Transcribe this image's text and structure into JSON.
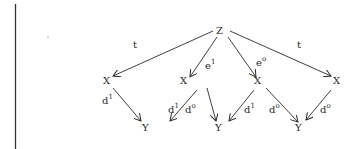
{
  "diagram": {
    "colors": {
      "ink": "#2a2a2a",
      "background": "#ffffff"
    },
    "nodes": {
      "z": {
        "label": "Z",
        "x": 220,
        "y": 33
      },
      "x1": {
        "label": "X",
        "x": 105,
        "y": 83
      },
      "x2": {
        "label": "X",
        "x": 210,
        "y": 83
      },
      "x3": {
        "label": "X",
        "x": 280,
        "y": 83
      },
      "x4": {
        "label": "X",
        "x": 339,
        "y": 83
      },
      "y1": {
        "label": "Y",
        "x": 146,
        "y": 131
      },
      "y2": {
        "label": "Y",
        "x": 219,
        "y": 131
      },
      "y3": {
        "label": "Y",
        "x": 299,
        "y": 131
      },
      "y4": {
        "label": "Y",
        "x": 346,
        "y": 131
      }
    },
    "edges": [
      {
        "from": "z",
        "to": "x1",
        "label": "t",
        "sup": ""
      },
      {
        "from": "z",
        "to": "x2",
        "label": "e",
        "sup": "1"
      },
      {
        "from": "z",
        "to": "x3",
        "label": "e",
        "sup": "o"
      },
      {
        "from": "z",
        "to": "x4",
        "label": "t",
        "sup": ""
      },
      {
        "from": "x1",
        "to": "y1",
        "label": "d",
        "sup": "1"
      },
      {
        "from": "x2",
        "to": "y1",
        "label": "d",
        "sup": "1"
      },
      {
        "from": "x2",
        "to": "y2",
        "label": "d",
        "sup": "o"
      },
      {
        "from": "x3",
        "to": "y2",
        "label": "d",
        "sup": "1"
      },
      {
        "from": "x3",
        "to": "y3",
        "label": "d",
        "sup": "o"
      },
      {
        "from": "x4",
        "to": "y3",
        "label": "d",
        "sup": "o"
      }
    ],
    "labels": {
      "t_left": "t",
      "e1_base": "e",
      "e1_sup": "1",
      "e0_base": "e",
      "e0_sup": "o",
      "t_right": "t",
      "d1_a_base": "d",
      "d1_a_sup": "1",
      "d1_b_base": "d",
      "d1_b_sup": "1",
      "d0_b_base": "d",
      "d0_b_sup": "o",
      "d1_c_base": "d",
      "d1_c_sup": "1",
      "d0_c_base": "d",
      "d0_c_sup": "o",
      "d0_d_base": "d",
      "d0_d_sup": "o"
    }
  }
}
